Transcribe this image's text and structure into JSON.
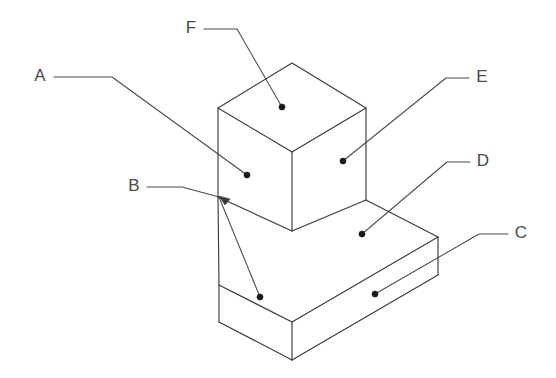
{
  "figure": {
    "background_color": "#ffffff",
    "line_color": "#3a3a3a",
    "leader_color": "#4a4a4a",
    "label_color": "#4a4a4a",
    "dot_color": "#1b1b1b",
    "width": 556,
    "height": 378
  },
  "callouts": [
    {
      "id": "a",
      "label": "A",
      "label_x": 40,
      "label_y": 77,
      "target": "upper block front-left face",
      "dot_x": 247,
      "dot_y": 175,
      "path": "M 54 77 L 112 77 L 247 175",
      "has_arrowhead": false
    },
    {
      "id": "b",
      "label": "B",
      "label_x": 134,
      "label_y": 187,
      "target": "base slab back-left top corner",
      "dot_x": 260,
      "dot_y": 297,
      "path": "M 147 187 L 182 187 L 219 197",
      "second_path": "M 219 197 L 260 297",
      "has_arrowhead": true,
      "arrow_x": 219,
      "arrow_y": 197
    },
    {
      "id": "c",
      "label": "C",
      "label_x": 521,
      "label_y": 234,
      "target": "base slab front-right face",
      "dot_x": 375,
      "dot_y": 294,
      "path": "M 508 234 L 479 234 L 375 294",
      "has_arrowhead": false
    },
    {
      "id": "d",
      "label": "D",
      "label_x": 483,
      "label_y": 162,
      "target": "base slab top face",
      "dot_x": 362,
      "dot_y": 234,
      "path": "M 470 162 L 447 162 L 362 234",
      "has_arrowhead": false
    },
    {
      "id": "e",
      "label": "E",
      "label_x": 482,
      "label_y": 78,
      "target": "upper block front-right face",
      "dot_x": 343,
      "dot_y": 161,
      "path": "M 469 78 L 446 78 L 343 161",
      "has_arrowhead": false
    },
    {
      "id": "f",
      "label": "F",
      "label_x": 191,
      "label_y": 29,
      "target": "upper block top face",
      "dot_x": 282,
      "dot_y": 107,
      "path": "M 204 29 L 237 29 L 282 107",
      "has_arrowhead": false
    }
  ],
  "geometry": {
    "upper_block": {
      "name": "upper cube",
      "top_face": "218,108 292,63 366,108 292,152",
      "left_face": "218,108 292,152 292,231 218,197",
      "right_face": "292,152 366,108 366,200 292,231"
    },
    "base_slab": {
      "name": "lower rectangular base",
      "top_face": "218,197 292,231 366,200 438,237 292,322 219,285",
      "left_face": "219,285 292,322 292,360 219,322",
      "right_face": "292,322 438,237 438,275 292,360"
    }
  }
}
